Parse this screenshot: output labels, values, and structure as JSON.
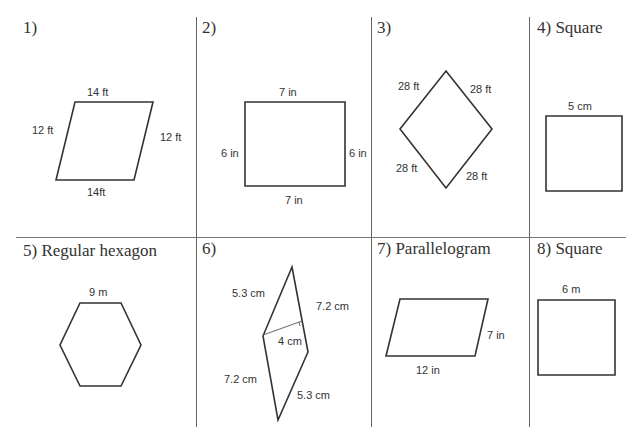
{
  "worksheet": {
    "problems": [
      {
        "number": "1)",
        "name": "",
        "dims": {
          "top": "14 ft",
          "bottom": "14ft",
          "left": "12 ft",
          "right": "12 ft"
        }
      },
      {
        "number": "2)",
        "name": "",
        "dims": {
          "top": "7 in",
          "bottom": "7 in",
          "left": "6 in",
          "right": "6 in"
        }
      },
      {
        "number": "3)",
        "name": "",
        "dims": {
          "top_left": "28 ft",
          "top_right": "28 ft",
          "bottom_left": "28 ft",
          "bottom_right": "28 ft"
        }
      },
      {
        "number": "4)",
        "name": "Square",
        "dims": {
          "top": "5 cm"
        }
      },
      {
        "number": "5)",
        "name": "Regular hexagon",
        "dims": {
          "top": "9 m"
        }
      },
      {
        "number": "6)",
        "name": "",
        "dims": {
          "top_left": "5.3 cm",
          "top_right": "7.2 cm",
          "height": "4 cm",
          "bottom_left": "7.2 cm",
          "bottom_right": "5.3 cm"
        }
      },
      {
        "number": "7)",
        "name": "Parallelogram",
        "dims": {
          "right": "7 in",
          "bottom": "12 in"
        }
      },
      {
        "number": "8)",
        "name": "Square",
        "dims": {
          "top": "6 m"
        }
      }
    ]
  },
  "labels": {
    "p1": "1)",
    "p2": "2)",
    "p3": "3)",
    "p4": "4) Square",
    "p5": "5) Regular hexagon",
    "p6": "6)",
    "p7": "7) Parallelogram",
    "p8": "8) Square"
  }
}
